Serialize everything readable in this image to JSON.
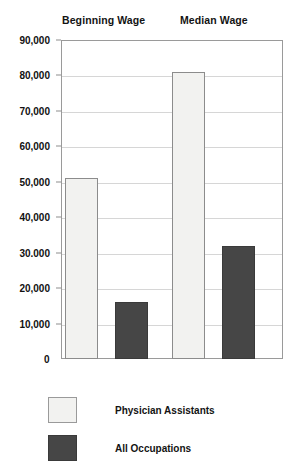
{
  "chart_data": {
    "type": "bar",
    "title": "",
    "subtitle": "",
    "xlabel": "",
    "ylabel": "",
    "categories": [
      "Beginning Wage",
      "Median Wage"
    ],
    "series": [
      {
        "name": "Physician Assistants",
        "values": [
          51000,
          81000
        ],
        "color": "#f2f2f0"
      },
      {
        "name": "All Occupations",
        "values": [
          16000,
          32000
        ],
        "color": "#464646"
      }
    ],
    "ylim": [
      0,
      90000
    ],
    "ytick_values": [
      0,
      10000,
      20000,
      30000,
      40000,
      50000,
      60000,
      70000,
      80000,
      90000
    ],
    "ytick_labels": [
      "0",
      "10,000",
      "20,000",
      "30.000",
      "40,000",
      "50,000",
      "60,000",
      "70,000",
      "80,000",
      "90,000"
    ],
    "grid": true,
    "legend_position": "bottom-left",
    "orientation": "vertical"
  },
  "axis": {
    "zero_label": "0"
  },
  "legend": {
    "items": [
      {
        "label": "Physician Assistants",
        "swatch": "light-swatch"
      },
      {
        "label": "All Occupations",
        "swatch": "dark-swatch"
      }
    ]
  }
}
